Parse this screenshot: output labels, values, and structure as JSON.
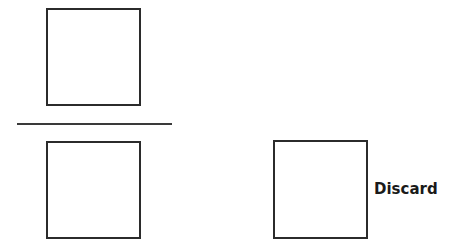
{
  "labels": {
    "discard": "Discard"
  },
  "colors": {
    "stroke": "#2b2b2b",
    "background": "#ffffff"
  }
}
